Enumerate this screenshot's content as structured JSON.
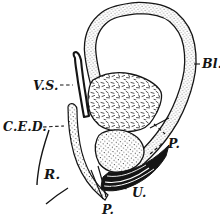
{
  "figure": {
    "colors": {
      "ink": "#151515",
      "background": "#ffffff"
    },
    "labels": {
      "vesicula_seminalis": "V.S.",
      "bladder": "Bl.",
      "common_ejaculatory_duct": "C.E.D.",
      "rectum": "R.",
      "prostate": "P.",
      "utricle": "U.",
      "penile_urethra": "P."
    }
  }
}
